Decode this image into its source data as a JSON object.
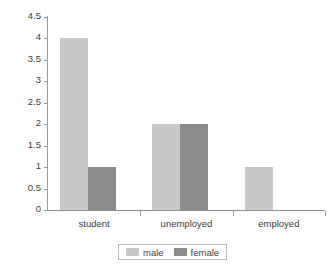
{
  "chart_data": {
    "type": "bar",
    "title": "",
    "subtitle": "",
    "xlabel": "",
    "ylabel": "",
    "categories": [
      "student",
      "unemployed",
      "employed"
    ],
    "series": [
      {
        "name": "male",
        "values": [
          4,
          2,
          1
        ],
        "color": "#c8c8c8"
      },
      {
        "name": "female",
        "values": [
          1,
          2,
          0
        ],
        "color": "#8c8c8c"
      }
    ],
    "ylim": [
      0,
      4.5
    ],
    "ytick_step": 0.5,
    "yticks": [
      "4.5",
      "4",
      "3.5",
      "3",
      "2.5",
      "2",
      "1.5",
      "1",
      "0.5",
      "0"
    ],
    "ytick_values": [
      4.5,
      4,
      3.5,
      3,
      2.5,
      2,
      1.5,
      1,
      0.5,
      0
    ],
    "grid": false,
    "legend_position": "bottom",
    "legend_entries": [
      "male",
      "female"
    ],
    "bar_grouping": "grouped",
    "annotations": []
  },
  "colors": {
    "male": "#c8c8c8",
    "female": "#8c8c8c",
    "axis": "#9a9a9a",
    "text": "#3d3d3d",
    "background": "#ffffff",
    "legend_border": "#b9b9b9"
  }
}
